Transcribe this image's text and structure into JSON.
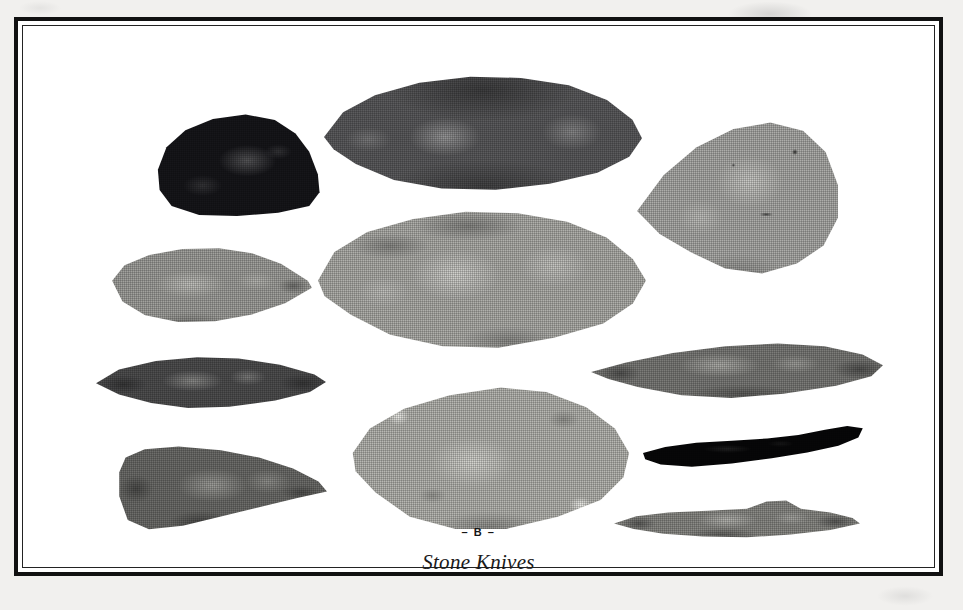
{
  "plate": {
    "letter": "– B –",
    "caption": "Stone Knives",
    "frame": {
      "outer_rule_color": "#111111",
      "inner_rule_color": "#232323",
      "field_color": "#ffffff",
      "paper_color": "#f1f0ee"
    },
    "artifacts": [
      {
        "id": "dark-domed-knife",
        "name": "Dark domed knife",
        "position": "upper-left",
        "shape": "rounded dome with flat base",
        "tone": "near-black",
        "color": "#16161a"
      },
      {
        "id": "large-dark-ovate-blade",
        "name": "Large dark elongated ovate blade",
        "position": "top-center",
        "shape": "elongated ovate, pointed both ends",
        "tone": "dark gray",
        "color": "#5c5c5e"
      },
      {
        "id": "light-teardrop-blade",
        "name": "Light teardrop blade",
        "position": "upper-right",
        "shape": "broad teardrop, point to the left",
        "tone": "light gray",
        "color": "#adadaa"
      },
      {
        "id": "gray-leaf-blade",
        "name": "Gray leaf-shaped blade",
        "position": "left-second-row",
        "shape": "leaf, point to the right",
        "tone": "medium gray",
        "color": "#a2a29e"
      },
      {
        "id": "large-light-ovate-blade",
        "name": "Large light ovate blade",
        "position": "center",
        "shape": "broad ovate with flake scars",
        "tone": "light gray",
        "color": "#b0b0ac"
      },
      {
        "id": "narrow-dark-lanceolate",
        "name": "Narrow dark lanceolate blade",
        "position": "left-third-row",
        "shape": "narrow bi-pointed lanceolate",
        "tone": "dark gray",
        "color": "#4f4f50"
      },
      {
        "id": "long-lanceolate-blade",
        "name": "Long lanceolate blade",
        "position": "right-third-row",
        "shape": "long bi-pointed lanceolate",
        "tone": "medium gray",
        "color": "#7c7c79"
      },
      {
        "id": "square-base-blade",
        "name": "Broad straight-base blade",
        "position": "bottom-left",
        "shape": "straight base tapering to a point",
        "tone": "medium-dark gray",
        "color": "#6e6e6b"
      },
      {
        "id": "mottled-ovate-blade",
        "name": "Large mottled ovate blade",
        "position": "bottom-center",
        "shape": "broad ovate with light cortex patches",
        "tone": "pale mottled gray",
        "color": "#b8b8b3"
      },
      {
        "id": "black-crescent-blade",
        "name": "Black crescent blade",
        "position": "right-fourth-row",
        "shape": "curved crescent",
        "tone": "black",
        "color": "#070708"
      },
      {
        "id": "humped-elongated-blade",
        "name": "Humped elongated blade",
        "position": "bottom-right",
        "shape": "elongated with hump on upper edge",
        "tone": "medium gray",
        "color": "#8b8b87"
      }
    ]
  }
}
